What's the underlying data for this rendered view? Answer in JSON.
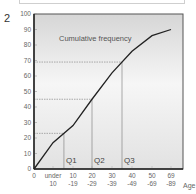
{
  "figure_number": "2",
  "chart_data": {
    "type": "line",
    "title": "Cumulative frequency",
    "xlabel": "Age",
    "ylabel": "",
    "ylim": [
      0,
      100
    ],
    "yticks": [
      "0",
      "10",
      "20",
      "30",
      "40",
      "50",
      "60",
      "70",
      "80",
      "90",
      "100"
    ],
    "categories": [
      "0",
      "under 10",
      "10 -19",
      "20 -29",
      "30 -39",
      "40 -49",
      "50 -69",
      "69 -89"
    ],
    "x_tick_lines": [
      [
        "0",
        ""
      ],
      [
        "under",
        "10"
      ],
      [
        "10",
        "-19"
      ],
      [
        "20",
        "-29"
      ],
      [
        "30",
        "-39"
      ],
      [
        "40",
        "-49"
      ],
      [
        "50",
        "-69"
      ],
      [
        "69",
        "-89"
      ]
    ],
    "series": [
      {
        "name": "Cumulative frequency",
        "values": [
          0,
          17,
          28,
          45,
          62,
          76,
          86,
          90
        ]
      }
    ],
    "quartiles": [
      {
        "label": "Q1",
        "y": 23
      },
      {
        "label": "Q2",
        "y": 45
      },
      {
        "label": "Q3",
        "y": 69
      }
    ],
    "grid": false,
    "legend": "none",
    "colors": {
      "line": "#222222",
      "background_top": "#d9d9d9",
      "background_mid": "#f4f4f4",
      "guides": "#777777"
    }
  }
}
